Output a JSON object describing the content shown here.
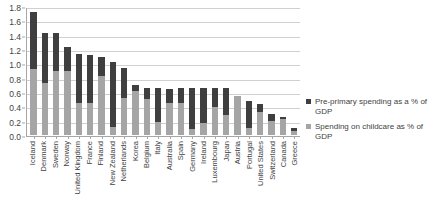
{
  "chart_data": {
    "type": "bar",
    "subtype": "stacked-vertical",
    "title": "",
    "xlabel": "",
    "ylabel": "",
    "ylim": [
      0.0,
      1.8
    ],
    "ytick_labels": [
      "1.8",
      "1.6",
      "1.4",
      "1.2",
      "1.0",
      "0.8",
      "0.6",
      "0.4",
      "0.2",
      "0.0"
    ],
    "ytick_values": [
      1.8,
      1.6,
      1.4,
      1.2,
      1.0,
      0.8,
      0.6,
      0.4,
      0.2,
      0.0
    ],
    "grid": true,
    "legend_position": "right",
    "categories": [
      "Iceland",
      "Denmark",
      "Sweden",
      "Norway",
      "United Kingdom",
      "France",
      "Finland",
      "New Zealand",
      "Netherlands",
      "Korea",
      "Belgium",
      "Italy",
      "Australia",
      "Spain",
      "Germany",
      "Ireland",
      "Luxembourg",
      "Japan",
      "Austria",
      "Portugal",
      "United States",
      "Switzerland",
      "Canada",
      "Greece"
    ],
    "series": [
      {
        "name": "Spending on childcare as % of GDP",
        "color": "#a5a5a5",
        "values": [
          0.92,
          0.73,
          0.89,
          0.89,
          0.45,
          0.44,
          0.83,
          0.11,
          0.51,
          0.62,
          0.5,
          0.18,
          0.44,
          0.45,
          0.09,
          0.17,
          0.39,
          0.28,
          0.55,
          0.1,
          0.32,
          0.2,
          0.23,
          0.05
        ]
      },
      {
        "name": "Pre-primary spending as a % of GDP",
        "color": "#3f3f3f",
        "values": [
          0.79,
          0.69,
          0.53,
          0.34,
          0.68,
          0.68,
          0.26,
          0.91,
          0.42,
          0.08,
          0.15,
          0.47,
          0.2,
          0.2,
          0.56,
          0.48,
          0.26,
          0.37,
          0.0,
          0.38,
          0.11,
          0.1,
          0.02,
          0.05
        ]
      }
    ],
    "totals": [
      1.71,
      1.42,
      1.42,
      1.23,
      1.13,
      1.12,
      1.09,
      1.02,
      0.93,
      0.7,
      0.65,
      0.65,
      0.64,
      0.65,
      0.65,
      0.65,
      0.65,
      0.65,
      0.55,
      0.48,
      0.43,
      0.3,
      0.25,
      0.1
    ]
  },
  "legend": {
    "entries": [
      {
        "label": "Pre-primary spending as a % of GDP",
        "color": "#3f3f3f"
      },
      {
        "label": "Spending on childcare as % of GDP",
        "color": "#a5a5a5"
      }
    ]
  }
}
